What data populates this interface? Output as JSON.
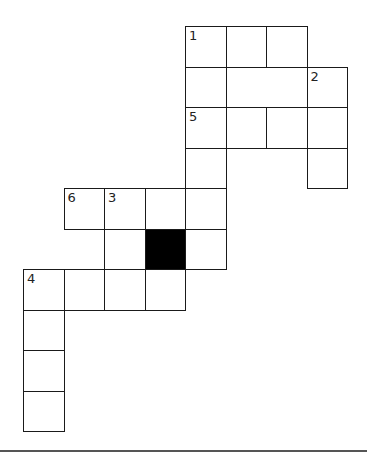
{
  "puzzle": {
    "type": "crossword",
    "cell_size": 40.5,
    "origin": {
      "x": 23,
      "y": 26
    },
    "colors": {
      "border": "#1a1a1a",
      "fill": "#ffffff",
      "block": "#000000",
      "number": "#222222"
    },
    "cells": [
      {
        "row": 0,
        "col": 4,
        "number": "1"
      },
      {
        "row": 0,
        "col": 5
      },
      {
        "row": 0,
        "col": 6
      },
      {
        "row": 1,
        "col": 4
      },
      {
        "row": 1,
        "col": 7,
        "number": "2"
      },
      {
        "row": 2,
        "col": 4,
        "number": "5"
      },
      {
        "row": 2,
        "col": 5
      },
      {
        "row": 2,
        "col": 6
      },
      {
        "row": 2,
        "col": 7
      },
      {
        "row": 3,
        "col": 4
      },
      {
        "row": 3,
        "col": 7
      },
      {
        "row": 4,
        "col": 1,
        "number": "6"
      },
      {
        "row": 4,
        "col": 2,
        "number": "3"
      },
      {
        "row": 4,
        "col": 3
      },
      {
        "row": 4,
        "col": 4
      },
      {
        "row": 5,
        "col": 2
      },
      {
        "row": 5,
        "col": 3,
        "black": true
      },
      {
        "row": 5,
        "col": 4
      },
      {
        "row": 6,
        "col": 0,
        "number": "4"
      },
      {
        "row": 6,
        "col": 1
      },
      {
        "row": 6,
        "col": 2
      },
      {
        "row": 6,
        "col": 3
      },
      {
        "row": 7,
        "col": 0
      },
      {
        "row": 8,
        "col": 0
      },
      {
        "row": 9,
        "col": 0
      }
    ],
    "clue_numbers": [
      "1",
      "2",
      "3",
      "4",
      "5",
      "6"
    ]
  }
}
